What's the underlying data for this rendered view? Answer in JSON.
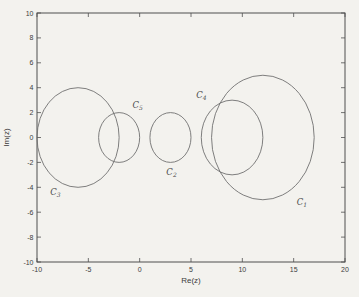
{
  "figure": {
    "kind": "scanned-matlab-figure",
    "xlabel": "Re(z)",
    "ylabel": "Im(z)"
  },
  "colors": {
    "background": "#f3f2ee",
    "axis": "#4f4f4f",
    "circle_stroke": "#707070",
    "text": "#3c3c3c",
    "circle_label": "#4a4a4a"
  },
  "chart_data": {
    "type": "line",
    "title": "",
    "xlabel": "Re(z)",
    "ylabel": "Im(z)",
    "xlim": [
      -10,
      20
    ],
    "ylim": [
      -10,
      10
    ],
    "xticks": [
      -10,
      -5,
      0,
      5,
      10,
      15,
      20
    ],
    "xtick_labels": [
      "-10",
      "-5",
      "0",
      "5",
      "10",
      "15",
      "20"
    ],
    "yticks": [
      -10,
      -8,
      -6,
      -4,
      -2,
      0,
      2,
      4,
      6,
      8,
      10
    ],
    "ytick_labels": [
      "-10",
      "-8",
      "-6",
      "-4",
      "-2",
      "0",
      "2",
      "4",
      "6",
      "8",
      "10"
    ],
    "grid": false,
    "legend": null,
    "circles": [
      {
        "name": "C1",
        "label_main": "C",
        "label_sub": "1",
        "center": [
          12,
          0
        ],
        "radius": 5,
        "label_pos": [
          15.3,
          -5.4
        ]
      },
      {
        "name": "C2",
        "label_main": "C",
        "label_sub": "2",
        "center": [
          3,
          0
        ],
        "radius": 2,
        "label_pos": [
          2.6,
          -3.0
        ]
      },
      {
        "name": "C3",
        "label_main": "C",
        "label_sub": "3",
        "center": [
          -6,
          0
        ],
        "radius": 4,
        "label_pos": [
          -8.7,
          -4.6
        ]
      },
      {
        "name": "C4",
        "label_main": "C",
        "label_sub": "4",
        "center": [
          9,
          0
        ],
        "radius": 3,
        "label_pos": [
          5.5,
          3.2
        ]
      },
      {
        "name": "C5",
        "label_main": "C",
        "label_sub": "5",
        "center": [
          -2,
          0
        ],
        "radius": 2,
        "label_pos": [
          -0.7,
          2.4
        ]
      }
    ]
  }
}
